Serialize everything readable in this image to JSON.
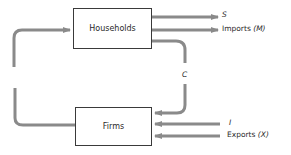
{
  "diagram": {
    "type": "circular-flow",
    "nodes": [
      {
        "id": "households",
        "label": "Households"
      },
      {
        "id": "firms",
        "label": "Firms"
      }
    ],
    "edges": [
      {
        "from": "firms",
        "to": "households",
        "label": ""
      },
      {
        "from": "households",
        "to": "out",
        "label": "S"
      },
      {
        "from": "households",
        "to": "out",
        "label": "Imports",
        "symbol": "(M)"
      },
      {
        "from": "households",
        "to": "firms",
        "label": "C"
      },
      {
        "from": "in",
        "to": "firms",
        "label": "I"
      },
      {
        "from": "in",
        "to": "firms",
        "label": "Exports",
        "symbol": "(X)"
      }
    ]
  },
  "labels": {
    "households": "Households",
    "firms": "Firms",
    "saving": "S",
    "imports": "Imports",
    "imports_symbol": "(M)",
    "consumption": "C",
    "investment": "I",
    "exports": "Exports",
    "exports_symbol": "(X)"
  },
  "colors": {
    "arrow": "#8a8a8a",
    "box_border": "#3a3a3a",
    "text": "#2a2a2a"
  }
}
